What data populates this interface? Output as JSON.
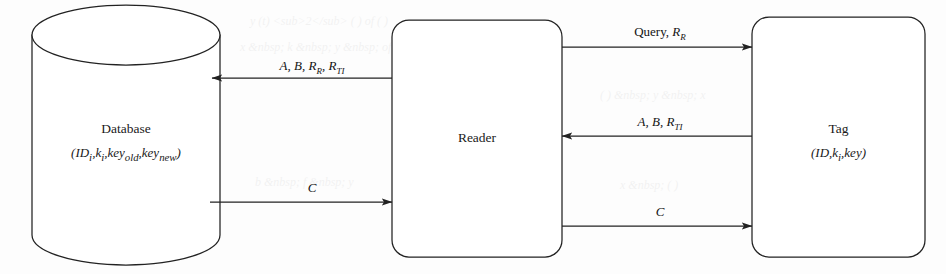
{
  "figure": {
    "type": "protocol-flow-diagram",
    "background_color": "#fdfdfd",
    "stroke_color": "#222222"
  },
  "nodes": [
    {
      "id": "database",
      "shape": "cylinder",
      "title": "Database",
      "subtitle": "(IDi,ki,keyold,keynew)"
    },
    {
      "id": "reader",
      "shape": "rounded-rect",
      "title": "Reader",
      "subtitle": ""
    },
    {
      "id": "tag",
      "shape": "rounded-rect",
      "title": "Tag",
      "subtitle": "(ID,ki,key)"
    }
  ],
  "edges": [
    {
      "id": "reader-to-database",
      "label": "A, B, RR, RTI",
      "from": "reader",
      "to": "database",
      "direction": "left"
    },
    {
      "id": "database-to-reader",
      "label": "C",
      "from": "database",
      "to": "reader",
      "direction": "right"
    },
    {
      "id": "reader-to-tag-query",
      "label": "Query, RR",
      "from": "reader",
      "to": "tag",
      "direction": "right"
    },
    {
      "id": "tag-to-reader",
      "label": "A, B, RTI",
      "from": "tag",
      "to": "reader",
      "direction": "left"
    },
    {
      "id": "reader-to-tag-c",
      "label": "C",
      "from": "reader",
      "to": "tag",
      "direction": "right"
    }
  ]
}
